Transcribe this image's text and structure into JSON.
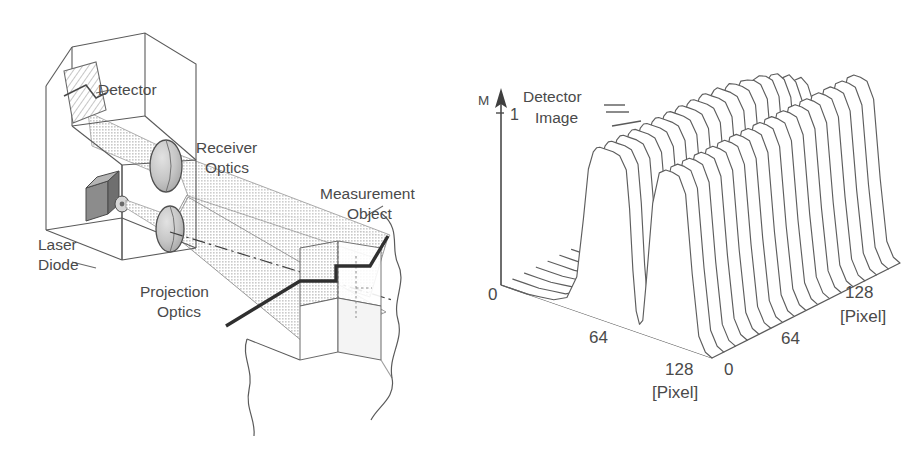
{
  "figure": {
    "panels": [
      {
        "letter": "a",
        "kind": "schematic-diagram",
        "title": "Laser triangulation sensor schematic",
        "labels": [
          {
            "name": "detector",
            "text": "Detector"
          },
          {
            "name": "receiver-optics",
            "text": "Receiver",
            "text2": "Optics"
          },
          {
            "name": "measurement-object",
            "text": "Measurement",
            "text2": "Object"
          },
          {
            "name": "laser-diode",
            "text": "Laser",
            "text2": "Diode"
          },
          {
            "name": "projection-optics",
            "text": "Projection",
            "text2": "Optics"
          }
        ]
      },
      {
        "letter": "b",
        "kind": "surface-plot",
        "annotation": {
          "line1": "Detector",
          "line2": "Image"
        }
      }
    ]
  },
  "chart_data": {
    "type": "line",
    "subtype": "waterfall-3d-surface",
    "title": "Detector Image",
    "zlabel": "M",
    "zticks": [
      "0",
      "1"
    ],
    "zlim": [
      0,
      1
    ],
    "xlabel": "[Pixel]",
    "ylabel": "[Pixel]",
    "xticks": [
      "0",
      "64",
      "128"
    ],
    "yticks": [
      "0",
      "64",
      "128"
    ],
    "xlim": [
      0,
      128
    ],
    "ylim": [
      0,
      128
    ],
    "grid": false,
    "legend": "none",
    "n_profiles": 17,
    "profile_x": [
      0,
      8,
      16,
      24,
      32,
      40,
      46,
      50,
      53,
      56,
      58,
      60,
      64,
      68,
      72,
      76,
      78,
      80,
      82,
      84,
      86,
      88,
      92,
      96,
      100,
      104,
      108,
      112,
      116,
      120,
      124,
      128
    ],
    "series": [
      {
        "name": "row-0",
        "values": [
          0.0,
          0.0,
          0.0,
          0.01,
          0.02,
          0.06,
          0.2,
          0.55,
          0.85,
          0.96,
          0.99,
          1.0,
          1.0,
          1.0,
          0.99,
          0.92,
          0.7,
          0.35,
          0.12,
          0.05,
          0.08,
          0.3,
          0.78,
          0.97,
          1.0,
          1.0,
          0.99,
          0.9,
          0.45,
          0.1,
          0.02,
          0.0
        ]
      },
      {
        "name": "row-1",
        "values": [
          0.0,
          0.0,
          0.0,
          0.01,
          0.02,
          0.06,
          0.2,
          0.55,
          0.85,
          0.96,
          0.99,
          1.0,
          1.0,
          1.0,
          0.99,
          0.92,
          0.7,
          0.35,
          0.12,
          0.05,
          0.08,
          0.3,
          0.78,
          0.97,
          1.0,
          1.0,
          0.99,
          0.9,
          0.45,
          0.1,
          0.02,
          0.0
        ]
      },
      {
        "name": "row-2",
        "values": [
          0.0,
          0.0,
          0.0,
          0.01,
          0.02,
          0.06,
          0.2,
          0.55,
          0.85,
          0.96,
          0.99,
          1.0,
          1.0,
          1.0,
          0.99,
          0.92,
          0.7,
          0.35,
          0.12,
          0.05,
          0.08,
          0.3,
          0.78,
          0.97,
          1.0,
          1.0,
          0.99,
          0.9,
          0.45,
          0.1,
          0.02,
          0.0
        ]
      },
      {
        "name": "row-3",
        "values": [
          0.0,
          0.0,
          0.0,
          0.01,
          0.02,
          0.06,
          0.2,
          0.55,
          0.85,
          0.96,
          0.99,
          1.0,
          1.0,
          1.0,
          0.99,
          0.92,
          0.7,
          0.35,
          0.12,
          0.05,
          0.08,
          0.3,
          0.78,
          0.97,
          1.0,
          1.0,
          0.99,
          0.9,
          0.45,
          0.1,
          0.02,
          0.0
        ]
      },
      {
        "name": "row-4",
        "values": [
          0.0,
          0.0,
          0.0,
          0.01,
          0.02,
          0.06,
          0.2,
          0.55,
          0.85,
          0.96,
          0.99,
          1.0,
          1.0,
          1.0,
          0.99,
          0.92,
          0.7,
          0.35,
          0.12,
          0.05,
          0.08,
          0.3,
          0.78,
          0.97,
          1.0,
          1.0,
          0.99,
          0.9,
          0.45,
          0.1,
          0.02,
          0.0
        ]
      },
      {
        "name": "row-5",
        "values": [
          0.0,
          0.0,
          0.0,
          0.01,
          0.02,
          0.06,
          0.2,
          0.55,
          0.85,
          0.96,
          0.99,
          1.0,
          1.0,
          1.0,
          0.99,
          0.92,
          0.7,
          0.35,
          0.12,
          0.05,
          0.08,
          0.3,
          0.78,
          0.97,
          1.0,
          1.0,
          0.99,
          0.9,
          0.45,
          0.1,
          0.02,
          0.0
        ]
      },
      {
        "name": "row-6",
        "values": [
          0.0,
          0.0,
          0.0,
          0.01,
          0.02,
          0.06,
          0.2,
          0.55,
          0.85,
          0.96,
          0.99,
          1.0,
          1.0,
          1.0,
          0.99,
          0.92,
          0.7,
          0.35,
          0.12,
          0.05,
          0.08,
          0.3,
          0.78,
          0.97,
          1.0,
          1.0,
          0.99,
          0.9,
          0.45,
          0.1,
          0.02,
          0.0
        ]
      },
      {
        "name": "row-7",
        "values": [
          0.0,
          0.0,
          0.0,
          0.01,
          0.02,
          0.06,
          0.2,
          0.55,
          0.85,
          0.96,
          0.99,
          1.0,
          1.0,
          1.0,
          0.99,
          0.92,
          0.7,
          0.35,
          0.12,
          0.05,
          0.08,
          0.3,
          0.78,
          0.97,
          1.0,
          1.0,
          0.99,
          0.9,
          0.45,
          0.1,
          0.02,
          0.0
        ]
      },
      {
        "name": "row-8",
        "values": [
          0.0,
          0.0,
          0.0,
          0.01,
          0.02,
          0.06,
          0.2,
          0.55,
          0.85,
          0.96,
          0.99,
          1.0,
          1.0,
          1.0,
          0.99,
          0.92,
          0.7,
          0.35,
          0.12,
          0.05,
          0.08,
          0.3,
          0.78,
          0.97,
          1.0,
          1.0,
          0.99,
          0.9,
          0.45,
          0.1,
          0.02,
          0.0
        ]
      },
      {
        "name": "row-9",
        "values": [
          0.0,
          0.0,
          0.0,
          0.01,
          0.02,
          0.06,
          0.2,
          0.55,
          0.85,
          0.96,
          0.99,
          1.0,
          1.0,
          1.0,
          0.99,
          0.92,
          0.7,
          0.35,
          0.12,
          0.05,
          0.08,
          0.3,
          0.78,
          0.97,
          1.0,
          1.0,
          0.99,
          0.9,
          0.45,
          0.1,
          0.02,
          0.0
        ]
      },
      {
        "name": "row-10",
        "values": [
          0.0,
          0.0,
          0.0,
          0.01,
          0.02,
          0.06,
          0.18,
          0.5,
          0.8,
          0.94,
          0.98,
          1.0,
          1.0,
          1.0,
          0.99,
          0.92,
          0.7,
          0.35,
          0.12,
          0.05,
          0.08,
          0.3,
          0.78,
          0.97,
          1.0,
          1.0,
          0.99,
          0.9,
          0.45,
          0.1,
          0.02,
          0.0
        ]
      },
      {
        "name": "row-11",
        "values": [
          0.0,
          0.0,
          0.0,
          0.01,
          0.02,
          0.05,
          0.15,
          0.42,
          0.72,
          0.9,
          0.96,
          0.99,
          1.0,
          1.0,
          0.99,
          0.92,
          0.7,
          0.35,
          0.12,
          0.05,
          0.08,
          0.3,
          0.78,
          0.97,
          1.0,
          1.0,
          0.99,
          0.9,
          0.45,
          0.1,
          0.02,
          0.0
        ]
      },
      {
        "name": "row-12",
        "values": [
          0.0,
          0.0,
          0.0,
          0.01,
          0.02,
          0.05,
          0.12,
          0.34,
          0.62,
          0.82,
          0.92,
          0.97,
          0.99,
          1.0,
          0.99,
          0.92,
          0.7,
          0.35,
          0.12,
          0.05,
          0.08,
          0.3,
          0.78,
          0.97,
          1.0,
          1.0,
          0.99,
          0.9,
          0.45,
          0.1,
          0.02,
          0.0
        ]
      },
      {
        "name": "row-13",
        "values": [
          0.0,
          0.0,
          0.0,
          0.0,
          0.01,
          0.04,
          0.1,
          0.26,
          0.5,
          0.72,
          0.86,
          0.94,
          0.98,
          0.99,
          0.98,
          0.9,
          0.68,
          0.33,
          0.11,
          0.05,
          0.08,
          0.3,
          0.78,
          0.97,
          1.0,
          1.0,
          0.99,
          0.9,
          0.45,
          0.1,
          0.02,
          0.0
        ]
      },
      {
        "name": "row-14",
        "values": [
          0.0,
          0.0,
          0.0,
          0.0,
          0.01,
          0.03,
          0.08,
          0.2,
          0.4,
          0.62,
          0.78,
          0.88,
          0.95,
          0.97,
          0.95,
          0.86,
          0.64,
          0.3,
          0.1,
          0.04,
          0.08,
          0.3,
          0.78,
          0.97,
          1.0,
          1.0,
          0.99,
          0.9,
          0.45,
          0.1,
          0.02,
          0.0
        ]
      },
      {
        "name": "row-15",
        "values": [
          0.0,
          0.0,
          0.0,
          0.0,
          0.01,
          0.03,
          0.06,
          0.15,
          0.32,
          0.52,
          0.68,
          0.8,
          0.9,
          0.93,
          0.9,
          0.8,
          0.58,
          0.27,
          0.09,
          0.04,
          0.08,
          0.3,
          0.78,
          0.97,
          1.0,
          1.0,
          0.99,
          0.9,
          0.45,
          0.1,
          0.02,
          0.0
        ]
      },
      {
        "name": "row-16",
        "values": [
          0.0,
          0.0,
          0.0,
          0.0,
          0.01,
          0.02,
          0.05,
          0.12,
          0.26,
          0.44,
          0.6,
          0.73,
          0.85,
          0.88,
          0.85,
          0.74,
          0.52,
          0.24,
          0.08,
          0.03,
          0.08,
          0.3,
          0.78,
          0.97,
          1.0,
          1.0,
          0.99,
          0.9,
          0.45,
          0.1,
          0.02,
          0.0
        ]
      }
    ]
  },
  "style": {
    "ink": "#4a4a4a",
    "ink_dark": "#333333",
    "fill_light": "#d9d9d9",
    "fill_mid": "#c2c2c2",
    "background": "#ffffff"
  }
}
